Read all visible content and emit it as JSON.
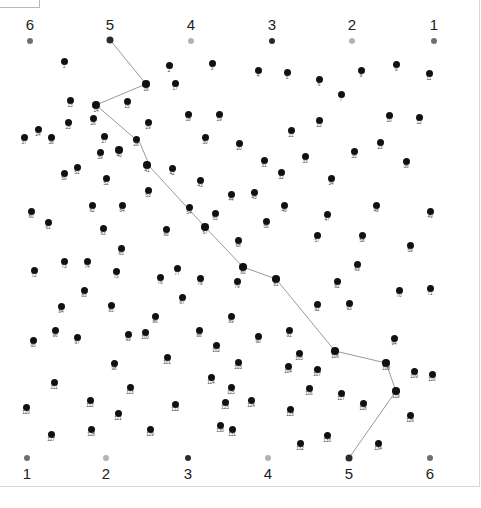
{
  "canvas": {
    "width": 481,
    "height": 508,
    "background": "#ffffff"
  },
  "colors": {
    "dot": "#111111",
    "dot_label": "#3a3a3a",
    "marker_dark": "#2b2b2b",
    "marker_mid": "#6f6f6f",
    "marker_light": "#b3b3b3",
    "path": "#9a9a9a",
    "frame": "#d9d9d9",
    "corner_box_border": "#b8b8b8"
  },
  "corner_box": {
    "present": true,
    "label": ""
  },
  "top_markers": [
    {
      "label": "6",
      "x": 30,
      "y": 41,
      "shade": "marker_mid",
      "size": 6
    },
    {
      "label": "5",
      "x": 110,
      "y": 40,
      "shade": "marker_dark",
      "size": 7
    },
    {
      "label": "4",
      "x": 191,
      "y": 41,
      "shade": "marker_light",
      "size": 6
    },
    {
      "label": "3",
      "x": 272,
      "y": 41,
      "shade": "marker_dark",
      "size": 6
    },
    {
      "label": "2",
      "x": 352,
      "y": 41,
      "shade": "marker_light",
      "size": 6
    },
    {
      "label": "1",
      "x": 434,
      "y": 41,
      "shade": "marker_mid",
      "size": 6
    }
  ],
  "top_marker_label_y": 24,
  "bottom_markers": [
    {
      "label": "1",
      "x": 27,
      "y": 458,
      "shade": "marker_mid",
      "size": 6
    },
    {
      "label": "2",
      "x": 106,
      "y": 458,
      "shade": "marker_light",
      "size": 6
    },
    {
      "label": "3",
      "x": 188,
      "y": 458,
      "shade": "marker_dark",
      "size": 6
    },
    {
      "label": "4",
      "x": 268,
      "y": 458,
      "shade": "marker_light",
      "size": 6
    },
    {
      "label": "5",
      "x": 349,
      "y": 458,
      "shade": "marker_dark",
      "size": 7
    },
    {
      "label": "6",
      "x": 430,
      "y": 458,
      "shade": "marker_mid",
      "size": 6
    }
  ],
  "bottom_marker_label_y": 473,
  "path": {
    "stroke": "#9a9a9a",
    "stroke_width": 1,
    "points": [
      [
        110,
        40
      ],
      [
        146,
        84
      ],
      [
        96,
        105
      ],
      [
        140,
        143
      ],
      [
        150,
        167
      ],
      [
        205,
        227
      ],
      [
        243,
        267
      ],
      [
        276,
        279
      ],
      [
        335,
        351
      ],
      [
        386,
        363
      ],
      [
        396,
        391
      ],
      [
        349,
        458
      ]
    ],
    "via_dots": [
      16,
      14,
      40,
      41,
      67,
      80,
      81,
      106,
      108,
      119
    ]
  },
  "dots": [
    {
      "n": 1,
      "x": 64,
      "y": 61
    },
    {
      "n": 2,
      "x": 169,
      "y": 65
    },
    {
      "n": 3,
      "x": 212,
      "y": 63
    },
    {
      "n": 4,
      "x": 258,
      "y": 70
    },
    {
      "n": 5,
      "x": 287,
      "y": 72
    },
    {
      "n": 6,
      "x": 319,
      "y": 79
    },
    {
      "n": 7,
      "x": 341,
      "y": 94
    },
    {
      "n": 8,
      "x": 361,
      "y": 70
    },
    {
      "n": 9,
      "x": 396,
      "y": 64
    },
    {
      "n": 10,
      "x": 389,
      "y": 115
    },
    {
      "n": 11,
      "x": 429,
      "y": 73
    },
    {
      "n": 12,
      "x": 419,
      "y": 117
    },
    {
      "n": 13,
      "x": 70,
      "y": 100
    },
    {
      "n": 14,
      "x": 96,
      "y": 105
    },
    {
      "n": 15,
      "x": 127,
      "y": 101
    },
    {
      "n": 16,
      "x": 146,
      "y": 84
    },
    {
      "n": 17,
      "x": 175,
      "y": 83
    },
    {
      "n": 18,
      "x": 188,
      "y": 114
    },
    {
      "n": 19,
      "x": 219,
      "y": 114
    },
    {
      "n": 20,
      "x": 239,
      "y": 143
    },
    {
      "n": 21,
      "x": 291,
      "y": 130
    },
    {
      "n": 22,
      "x": 319,
      "y": 120
    },
    {
      "n": 23,
      "x": 380,
      "y": 142
    },
    {
      "n": 24,
      "x": 38,
      "y": 129
    },
    {
      "n": 25,
      "x": 68,
      "y": 122
    },
    {
      "n": 26,
      "x": 93,
      "y": 118
    },
    {
      "n": 27,
      "x": 104,
      "y": 136
    },
    {
      "n": 28,
      "x": 136,
      "y": 139
    },
    {
      "n": 29,
      "x": 148,
      "y": 122
    },
    {
      "n": 30,
      "x": 205,
      "y": 137
    },
    {
      "n": 31,
      "x": 264,
      "y": 160
    },
    {
      "n": 32,
      "x": 281,
      "y": 172
    },
    {
      "n": 33,
      "x": 305,
      "y": 156
    },
    {
      "n": 34,
      "x": 331,
      "y": 178
    },
    {
      "n": 35,
      "x": 354,
      "y": 151
    },
    {
      "n": 36,
      "x": 406,
      "y": 161
    },
    {
      "n": 37,
      "x": 24,
      "y": 137
    },
    {
      "n": 38,
      "x": 51,
      "y": 137
    },
    {
      "n": 39,
      "x": 100,
      "y": 152
    },
    {
      "n": 40,
      "x": 119,
      "y": 150
    },
    {
      "n": 41,
      "x": 147,
      "y": 165
    },
    {
      "n": 42,
      "x": 172,
      "y": 168
    },
    {
      "n": 43,
      "x": 200,
      "y": 180
    },
    {
      "n": 44,
      "x": 231,
      "y": 194
    },
    {
      "n": 45,
      "x": 254,
      "y": 192
    },
    {
      "n": 46,
      "x": 284,
      "y": 205
    },
    {
      "n": 47,
      "x": 327,
      "y": 214
    },
    {
      "n": 48,
      "x": 376,
      "y": 205
    },
    {
      "n": 49,
      "x": 430,
      "y": 211
    },
    {
      "n": 50,
      "x": 64,
      "y": 173
    },
    {
      "n": 51,
      "x": 77,
      "y": 167
    },
    {
      "n": 52,
      "x": 106,
      "y": 178
    },
    {
      "n": 53,
      "x": 148,
      "y": 190
    },
    {
      "n": 54,
      "x": 189,
      "y": 207
    },
    {
      "n": 55,
      "x": 215,
      "y": 213
    },
    {
      "n": 56,
      "x": 266,
      "y": 221
    },
    {
      "n": 57,
      "x": 317,
      "y": 235
    },
    {
      "n": 58,
      "x": 362,
      "y": 235
    },
    {
      "n": 59,
      "x": 410,
      "y": 245
    },
    {
      "n": 60,
      "x": 31,
      "y": 211
    },
    {
      "n": 61,
      "x": 48,
      "y": 222
    },
    {
      "n": 62,
      "x": 92,
      "y": 205
    },
    {
      "n": 63,
      "x": 103,
      "y": 228
    },
    {
      "n": 64,
      "x": 122,
      "y": 205
    },
    {
      "n": 65,
      "x": 121,
      "y": 248
    },
    {
      "n": 66,
      "x": 166,
      "y": 229
    },
    {
      "n": 67,
      "x": 205,
      "y": 227
    },
    {
      "n": 68,
      "x": 238,
      "y": 240
    },
    {
      "n": 69,
      "x": 357,
      "y": 264
    },
    {
      "n": 70,
      "x": 399,
      "y": 290
    },
    {
      "n": 71,
      "x": 430,
      "y": 288
    },
    {
      "n": 72,
      "x": 34,
      "y": 270
    },
    {
      "n": 73,
      "x": 64,
      "y": 261
    },
    {
      "n": 74,
      "x": 87,
      "y": 261
    },
    {
      "n": 75,
      "x": 116,
      "y": 271
    },
    {
      "n": 76,
      "x": 160,
      "y": 277
    },
    {
      "n": 77,
      "x": 177,
      "y": 268
    },
    {
      "n": 78,
      "x": 200,
      "y": 278
    },
    {
      "n": 79,
      "x": 237,
      "y": 281
    },
    {
      "n": 80,
      "x": 243,
      "y": 267
    },
    {
      "n": 81,
      "x": 276,
      "y": 279
    },
    {
      "n": 82,
      "x": 337,
      "y": 281
    },
    {
      "n": 83,
      "x": 84,
      "y": 290
    },
    {
      "n": 84,
      "x": 61,
      "y": 306
    },
    {
      "n": 85,
      "x": 111,
      "y": 305
    },
    {
      "n": 86,
      "x": 155,
      "y": 316
    },
    {
      "n": 87,
      "x": 182,
      "y": 297
    },
    {
      "n": 88,
      "x": 199,
      "y": 330
    },
    {
      "n": 89,
      "x": 231,
      "y": 316
    },
    {
      "n": 90,
      "x": 258,
      "y": 336
    },
    {
      "n": 91,
      "x": 289,
      "y": 330
    },
    {
      "n": 92,
      "x": 317,
      "y": 304
    },
    {
      "n": 93,
      "x": 349,
      "y": 303
    },
    {
      "n": 94,
      "x": 394,
      "y": 338
    },
    {
      "n": 95,
      "x": 33,
      "y": 340
    },
    {
      "n": 96,
      "x": 55,
      "y": 330
    },
    {
      "n": 97,
      "x": 77,
      "y": 337
    },
    {
      "n": 98,
      "x": 114,
      "y": 363
    },
    {
      "n": 99,
      "x": 128,
      "y": 334
    },
    {
      "n": 100,
      "x": 145,
      "y": 332
    },
    {
      "n": 101,
      "x": 167,
      "y": 357
    },
    {
      "n": 102,
      "x": 216,
      "y": 345
    },
    {
      "n": 103,
      "x": 238,
      "y": 362
    },
    {
      "n": 104,
      "x": 288,
      "y": 366
    },
    {
      "n": 105,
      "x": 299,
      "y": 353
    },
    {
      "n": 106,
      "x": 335,
      "y": 351
    },
    {
      "n": 107,
      "x": 317,
      "y": 369
    },
    {
      "n": 108,
      "x": 386,
      "y": 363
    },
    {
      "n": 109,
      "x": 414,
      "y": 371
    },
    {
      "n": 110,
      "x": 432,
      "y": 374
    },
    {
      "n": 111,
      "x": 54,
      "y": 382
    },
    {
      "n": 112,
      "x": 90,
      "y": 400
    },
    {
      "n": 113,
      "x": 130,
      "y": 387
    },
    {
      "n": 114,
      "x": 211,
      "y": 377
    },
    {
      "n": 115,
      "x": 231,
      "y": 387
    },
    {
      "n": 116,
      "x": 309,
      "y": 388
    },
    {
      "n": 117,
      "x": 341,
      "y": 393
    },
    {
      "n": 118,
      "x": 363,
      "y": 403
    },
    {
      "n": 119,
      "x": 396,
      "y": 391
    },
    {
      "n": 120,
      "x": 26,
      "y": 407
    },
    {
      "n": 121,
      "x": 118,
      "y": 413
    },
    {
      "n": 122,
      "x": 175,
      "y": 404
    },
    {
      "n": 123,
      "x": 225,
      "y": 402
    },
    {
      "n": 124,
      "x": 251,
      "y": 400
    },
    {
      "n": 125,
      "x": 290,
      "y": 409
    },
    {
      "n": 126,
      "x": 410,
      "y": 415
    },
    {
      "n": 127,
      "x": 51,
      "y": 434
    },
    {
      "n": 128,
      "x": 91,
      "y": 429
    },
    {
      "n": 129,
      "x": 150,
      "y": 429
    },
    {
      "n": 130,
      "x": 220,
      "y": 425
    },
    {
      "n": 131,
      "x": 232,
      "y": 429
    },
    {
      "n": 132,
      "x": 300,
      "y": 443
    },
    {
      "n": 133,
      "x": 327,
      "y": 435
    },
    {
      "n": 134,
      "x": 378,
      "y": 443
    }
  ]
}
